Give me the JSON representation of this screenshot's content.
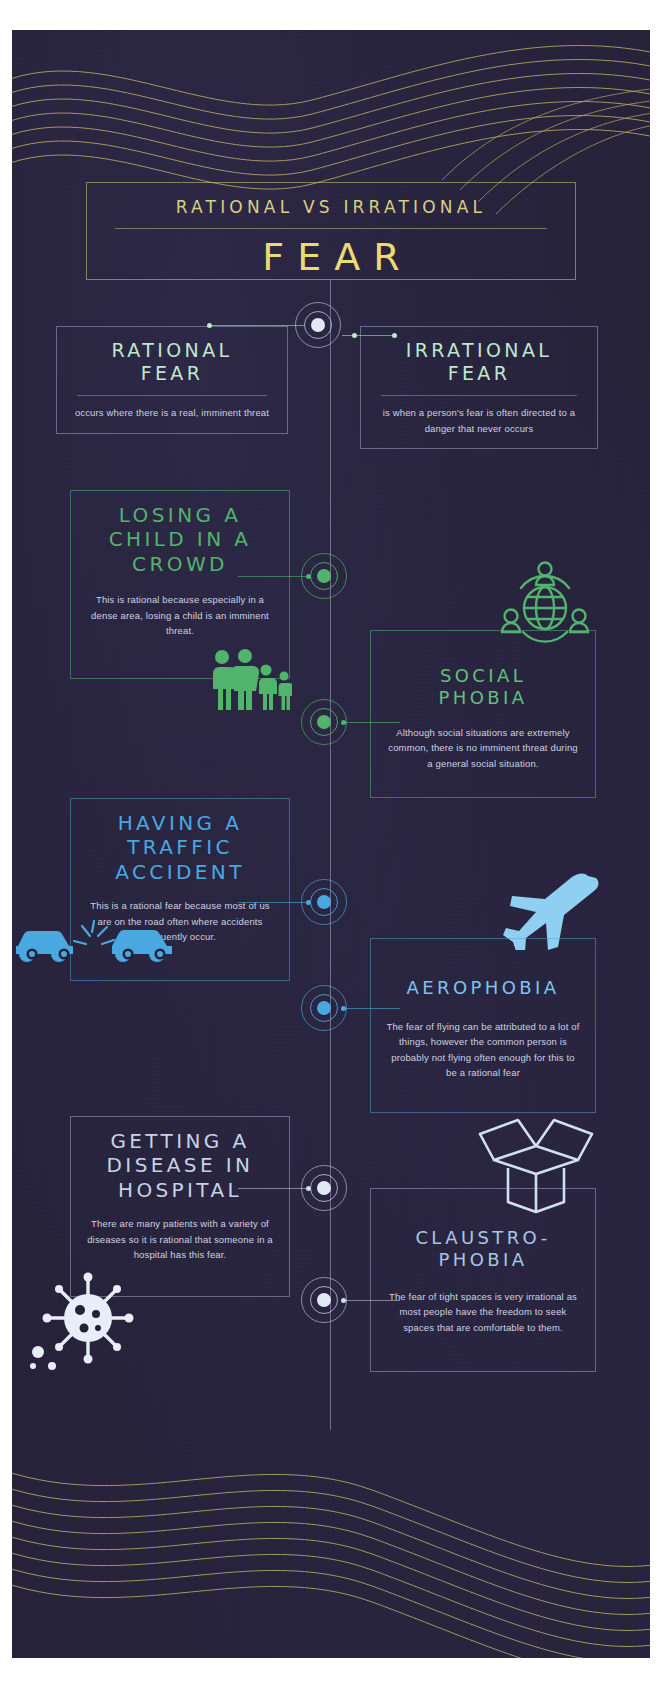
{
  "poster": {
    "title_sub": "RATIONAL VS IRRATIONAL",
    "title_main": "FEAR",
    "accent_gold": "#edda73",
    "accent_green": "#51b46c",
    "accent_blue": "#4aa8e0",
    "accent_mint": "#bfe8cd",
    "background": "#252139"
  },
  "definitions": [
    {
      "heading_line1": "RATIONAL",
      "heading_line2": "FEAR",
      "body": "occurs where there is a real, imminent threat",
      "side": "left"
    },
    {
      "heading_line1": "IRRATIONAL",
      "heading_line2": "FEAR",
      "body": "is when a person's fear is often directed to a danger that never occurs",
      "side": "right"
    }
  ],
  "pairs": [
    {
      "color": "#51b46c",
      "rational": {
        "heading_line1": "LOSING A",
        "heading_line2": "CHILD IN A",
        "heading_line3": "CROWD",
        "body": "This is rational because especially in a dense area, losing a child is an imminent threat.",
        "icon": "family-icon"
      },
      "irrational": {
        "heading_line1": "SOCIAL",
        "heading_line2": "PHOBIA",
        "body": "Although social situations are extremely common, there is no imminent threat during a general social situation.",
        "icon": "globe-people-icon"
      }
    },
    {
      "color": "#4aa8e0",
      "rational": {
        "heading_line1": "HAVING A",
        "heading_line2": "TRAFFIC",
        "heading_line3": "ACCIDENT",
        "body": "This is a rational fear because most of us are on the road often where accidents frequently occur.",
        "icon": "car-crash-icon"
      },
      "irrational": {
        "heading_line1": "AEROPHOBIA",
        "heading_line2": "",
        "body": "The fear of flying can be attributed to a lot of things, however the common person is probably not flying often enough for this to be a rational fear",
        "icon": "airplane-icon"
      }
    },
    {
      "color": "#c6d2e6",
      "rational": {
        "heading_line1": "GETTING A",
        "heading_line2": "DISEASE IN",
        "heading_line3": "HOSPITAL",
        "body": "There are many patients with a variety of diseases so it is rational that someone in a hospital has this fear.",
        "icon": "virus-icon"
      },
      "irrational": {
        "heading_line1": "CLAUSTRO-",
        "heading_line2": "PHOBIA",
        "body": "The fear of tight spaces is very irrational as most people have the freedom to seek spaces that are comfortable to them.",
        "icon": "open-box-icon"
      }
    }
  ]
}
